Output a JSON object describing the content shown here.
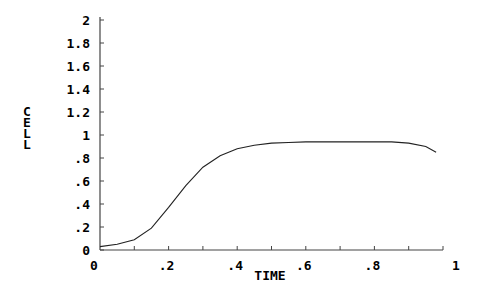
{
  "chart_data": {
    "type": "line",
    "title": "",
    "xlabel": "TIME",
    "ylabel": "CELL",
    "xlim": [
      0,
      1
    ],
    "ylim": [
      0,
      2
    ],
    "grid": false,
    "x_ticks": [
      0,
      0.2,
      0.4,
      0.6,
      0.8,
      1
    ],
    "x_tick_labels": [
      "0",
      ".2",
      ".4",
      ".6",
      ".8",
      "1"
    ],
    "x_minor_ticks": [
      0.1,
      0.3,
      0.5,
      0.7,
      0.9
    ],
    "y_ticks": [
      0,
      0.2,
      0.4,
      0.6,
      0.8,
      1,
      1.2,
      1.4,
      1.6,
      1.8,
      2
    ],
    "y_tick_labels": [
      "0",
      ".2",
      ".4",
      ".6",
      ".8",
      "1",
      "1.2",
      "1.4",
      "1.6",
      "1.8",
      "2"
    ],
    "x_origin_label": "0",
    "series": [
      {
        "name": "CELL",
        "color": "#222222",
        "x": [
          0,
          0.05,
          0.1,
          0.15,
          0.2,
          0.25,
          0.3,
          0.35,
          0.4,
          0.45,
          0.5,
          0.55,
          0.6,
          0.7,
          0.8,
          0.85,
          0.9,
          0.95,
          0.98
        ],
        "y": [
          0.03,
          0.05,
          0.09,
          0.19,
          0.37,
          0.56,
          0.72,
          0.82,
          0.88,
          0.91,
          0.93,
          0.935,
          0.94,
          0.94,
          0.94,
          0.94,
          0.93,
          0.9,
          0.85
        ]
      }
    ]
  }
}
